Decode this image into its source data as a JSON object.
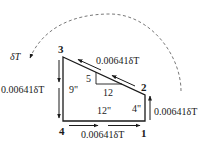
{
  "diagram": {
    "type": "shear flow free-body diagram",
    "nodes": [
      {
        "id": "1",
        "label": "1"
      },
      {
        "id": "2",
        "label": "2"
      },
      {
        "id": "3",
        "label": "3"
      },
      {
        "id": "4",
        "label": "4"
      }
    ],
    "edges": [
      {
        "from": "3",
        "to": "2",
        "label": "0.00641δT",
        "direction": "toward 3"
      },
      {
        "from": "3",
        "to": "4",
        "label": "0.00641δT",
        "direction": "downward"
      },
      {
        "from": "4",
        "to": "1",
        "label": "0.00641δT",
        "direction": "toward 1"
      },
      {
        "from": "1",
        "to": "2",
        "label": "0.00641δT",
        "direction": "upward"
      }
    ],
    "dimensions": {
      "left_height": "9\"",
      "bottom_width": "12\"",
      "right_height": "4\""
    },
    "slope_triangle": {
      "rise": "5",
      "run": "12"
    },
    "torque": {
      "label": "δT",
      "direction": "counterclockwise"
    },
    "colors": {
      "line": "#1a1a1a",
      "dashed_arc": "#555555"
    }
  }
}
